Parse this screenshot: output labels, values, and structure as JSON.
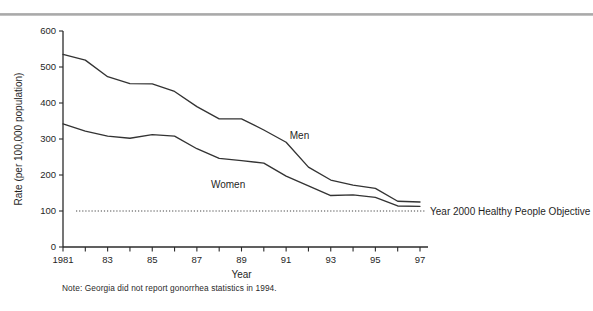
{
  "figure": {
    "note": "Note: Georgia did not report gonorrhea statistics in 1994.",
    "top_rule_color": "#b0b0b0",
    "line_color": "#333333"
  },
  "chart_data": {
    "type": "line",
    "title": "",
    "xlabel": "Year",
    "ylabel": "Rate (per 100,000 population)",
    "x": [
      1981,
      1982,
      1983,
      1984,
      1985,
      1986,
      1987,
      1988,
      1989,
      1990,
      1991,
      1992,
      1993,
      1994,
      1995,
      1996,
      1997
    ],
    "xtick_labels": [
      "1981",
      "",
      "83",
      "",
      "85",
      "",
      "87",
      "",
      "89",
      "",
      "91",
      "",
      "93",
      "",
      "95",
      "",
      "97"
    ],
    "xlim": [
      1981,
      1997
    ],
    "ylim": [
      0,
      600
    ],
    "yticks": [
      0,
      100,
      200,
      300,
      400,
      500,
      600
    ],
    "ytick_labels": [
      "0",
      "100",
      "200",
      "300",
      "400",
      "500",
      "600"
    ],
    "grid": false,
    "legend": "inline-annotations",
    "series": [
      {
        "name": "Men",
        "label_x": 1991.6,
        "label_y": 300,
        "values": [
          535,
          519,
          473,
          454,
          453,
          432,
          390,
          356,
          356,
          325,
          291,
          222,
          186,
          172,
          163,
          127,
          125
        ]
      },
      {
        "name": "Women",
        "label_x": 1988.4,
        "label_y": 163,
        "values": [
          342,
          322,
          308,
          302,
          312,
          308,
          273,
          246,
          240,
          233,
          197,
          170,
          143,
          145,
          138,
          114,
          113
        ]
      }
    ],
    "reference_line": {
      "label": "Year 2000 Healthy People Objective",
      "value": 100,
      "style": "dotted"
    }
  }
}
